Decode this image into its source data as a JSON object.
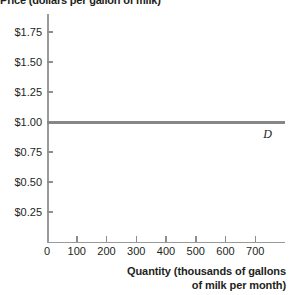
{
  "chart_data": {
    "type": "line",
    "title": "Price (dollars per gallon of milk)",
    "xlabel_line1": "Quantity (thousands of gallons",
    "xlabel_line2": "of milk per month)",
    "ylabel": "Price (dollars per gallon of milk)",
    "xlim": [
      0,
      800
    ],
    "ylim": [
      0,
      1.9
    ],
    "grid": false,
    "legend": "none",
    "x_ticks": [
      {
        "value": 0,
        "label": "0"
      },
      {
        "value": 100,
        "label": "100"
      },
      {
        "value": 200,
        "label": "200"
      },
      {
        "value": 300,
        "label": "300"
      },
      {
        "value": 400,
        "label": "400"
      },
      {
        "value": 500,
        "label": "500"
      },
      {
        "value": 600,
        "label": "600"
      },
      {
        "value": 700,
        "label": "700"
      }
    ],
    "y_ticks": [
      {
        "value": 1.75,
        "label": "$1.75"
      },
      {
        "value": 1.5,
        "label": "$1.50"
      },
      {
        "value": 1.25,
        "label": "$1.25"
      },
      {
        "value": 1.0,
        "label": "$1.00"
      },
      {
        "value": 0.75,
        "label": "$0.75"
      },
      {
        "value": 0.5,
        "label": "$0.50"
      },
      {
        "value": 0.25,
        "label": "$0.25"
      }
    ],
    "series": [
      {
        "name": "D",
        "annotation": "D",
        "color": "#878787",
        "price_level": 1.0,
        "x": [
          0,
          750
        ],
        "values": [
          1.0,
          1.0
        ]
      }
    ],
    "axis_color": "#9a9a9a",
    "text_color": "#231f20"
  }
}
